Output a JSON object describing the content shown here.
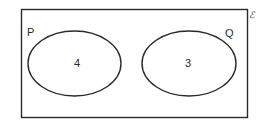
{
  "diagram": {
    "type": "venn",
    "universal_set": {
      "symbol": "ℰ"
    },
    "sets": [
      {
        "label": "P",
        "value": "4"
      },
      {
        "label": "Q",
        "value": "3"
      }
    ],
    "intersection": "none",
    "colors": {
      "stroke": "#2a2a2a",
      "background": "#ffffff"
    }
  }
}
